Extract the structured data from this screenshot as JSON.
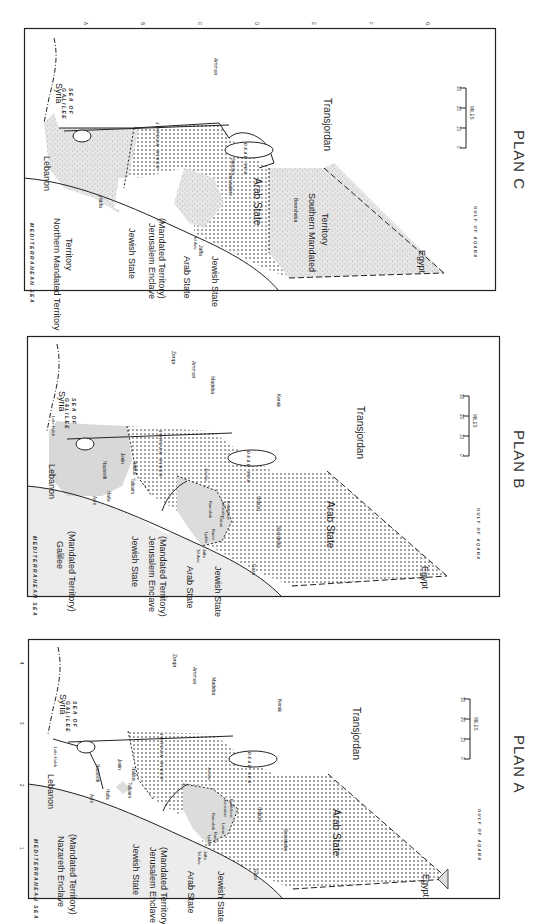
{
  "figure": {
    "panels": [
      {
        "id": "plan-c",
        "title": "PLAN C",
        "regions": {
          "north": "Northern Mandated Territory",
          "jewish": "Jewish State",
          "enclave": "Jerusalem Enclave",
          "enclave_sub": "(Mandated Territory)",
          "arab_west": "Arab State",
          "jewish_south": "Jewish State",
          "arab_main": "Arab State",
          "south": "Southern Mandated",
          "south2": "Territory"
        },
        "cities": {
          "haifa": "Haifa",
          "telaviv": "Tel Aviv",
          "jaffa": "Jaffa",
          "jerusalem": "Jerusalem",
          "jericho": "Jericho",
          "beersheba": "Beersheba",
          "amman": "Ammon"
        }
      },
      {
        "id": "plan-b",
        "title": "PLAN B",
        "regions": {
          "north": "Galilee",
          "north_sub": "(Mandated Territory)",
          "jewish": "Jewish State",
          "enclave": "Jerusalem Enclave",
          "enclave_sub": "(Mandated Territory)",
          "arab_west": "Arab State",
          "jewish_south": "Jewish State",
          "arab_main": "Arab State"
        },
        "cities": {
          "acre": "Acre",
          "haifa": "Haifa",
          "nazareth": "Nazareth",
          "jenin": "Jenin",
          "tulkarm": "Tulkarm",
          "nablus": "Nablus",
          "jericho": "Jericho",
          "ramallah": "Ramallah",
          "jerusalem": "Jerusalem",
          "bethlehem": "Bethlehem",
          "lydda": "Lydda",
          "ramle": "Ramle",
          "latrun": "Latrun",
          "telaviv": "Tel Aviv",
          "jaffa": "Jaffa",
          "gaza": "Gaza",
          "hebron": "Hebron",
          "beersheba": "Beersheba",
          "zerqa": "Zerqa",
          "amman": "Ammon",
          "madeba": "Madeba",
          "kerak": "Kerak",
          "lakehuleh": "Lake Huleh"
        }
      },
      {
        "id": "plan-a",
        "title": "PLAN A",
        "regions": {
          "north": "Nazareth Enclave",
          "north_sub": "(Mandated Territory)",
          "jewish": "Jewish State",
          "enclave": "Jerusalem Enclave",
          "enclave_sub": "(Mandated Territory)",
          "arab_west": "Arab State",
          "jewish_south": "Jewish State",
          "arab_main": "Arab State"
        },
        "cities": {
          "acre": "Acre",
          "haifa": "Haifa",
          "nazareth": "Nazareth",
          "jenin": "Jenin",
          "tulkarm": "Tulkarm",
          "nablus": "Nablus",
          "jericho": "Jericho",
          "ramallah": "Ramallah",
          "jerusalem": "Jerusalem",
          "bethlehem": "Bethlehem",
          "lydda": "Lydda",
          "ramle": "Ramle",
          "latrun": "Latrun",
          "telaviv": "Tel Aviv",
          "jaffa": "Jaffa",
          "gaza": "Gaza",
          "hebron": "Hebron",
          "beersheba": "Beersheba",
          "zerqa": "Zerqa",
          "amman": "Ammon",
          "madeba": "Madeba",
          "kerak": "Kerak",
          "lakehuleh": "Lake Huleh"
        }
      }
    ],
    "common": {
      "syria": "Syria",
      "lebanon": "Lebanon",
      "transjordan": "Transjordan",
      "egypt": "Egypt",
      "mediterranean": "MEDITERRANEAN SEA",
      "sea_of_galilee_1": "SEA OF",
      "sea_of_galilee_2": "GALILEE",
      "jordan_river": "JORDAN   RIVER",
      "dead_sea": "DEAD   SEA",
      "gulf_of_aqaba": "GULF OF AQABA",
      "scale": {
        "ticks": [
          "0",
          "10",
          "20",
          "30"
        ],
        "unit": "MILES"
      },
      "grid_cols": [
        "A",
        "B",
        "C",
        "D",
        "E",
        "F",
        "G"
      ],
      "grid_rows": [
        "4",
        "3",
        "2",
        "1"
      ]
    },
    "colors": {
      "ink": "#222222",
      "mandated_fill": "#dcdcdc",
      "sea_fill": "#ececec",
      "paper": "#ffffff"
    }
  }
}
